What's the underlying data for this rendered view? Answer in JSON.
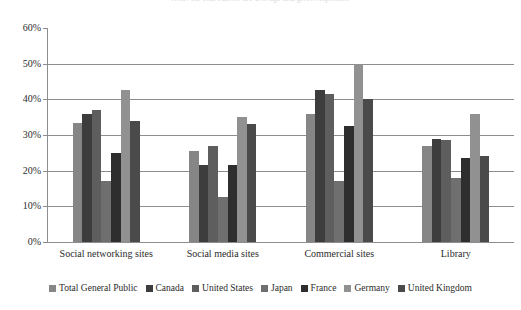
{
  "chart_data": {
    "type": "bar",
    "title": "Note: the chart above are average and given responses.",
    "xlabel": "",
    "ylabel": "",
    "ylim": [
      0,
      60
    ],
    "ytick_labels": [
      "0%",
      "10%",
      "20%",
      "30%",
      "40%",
      "50%",
      "60%"
    ],
    "ytick_values": [
      0,
      10,
      20,
      30,
      40,
      50,
      60
    ],
    "grid": true,
    "legend_position": "bottom",
    "categories": [
      "Social networking sites",
      "Social media sites",
      "Commercial sites",
      "Library"
    ],
    "series": [
      {
        "name": "Total General Public",
        "color": "#868686",
        "values": [
          33.5,
          25.5,
          36.0,
          27.0
        ]
      },
      {
        "name": "Canada",
        "color": "#3d3d3d",
        "values": [
          36.0,
          21.5,
          42.5,
          29.0
        ]
      },
      {
        "name": "United States",
        "color": "#5e5e5e",
        "values": [
          37.0,
          27.0,
          41.5,
          28.5
        ]
      },
      {
        "name": "Japan",
        "color": "#6f6f6f",
        "values": [
          17.0,
          12.5,
          17.0,
          18.0
        ]
      },
      {
        "name": "France",
        "color": "#2e2e2e",
        "values": [
          25.0,
          21.5,
          32.5,
          23.5
        ]
      },
      {
        "name": "Germany",
        "color": "#919191",
        "values": [
          42.5,
          35.0,
          50.0,
          36.0
        ]
      },
      {
        "name": "United Kingdom",
        "color": "#4a4a4a",
        "values": [
          34.0,
          33.0,
          40.0,
          24.0
        ]
      }
    ]
  },
  "axis_color": "#8d8d8d"
}
